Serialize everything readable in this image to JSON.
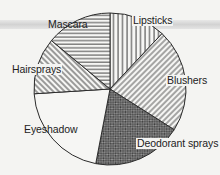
{
  "chart_data": {
    "type": "pie",
    "title": "",
    "start_angle_deg": 0,
    "direction": "clockwise",
    "categories": [
      "Lipsticks",
      "Blushers",
      "Deodorant sprays",
      "Eyeshadow",
      "Hairsprays",
      "Mascara"
    ],
    "values": [
      12,
      22,
      19,
      21,
      12,
      14
    ],
    "units": "percent (estimated from slice angles)",
    "patterns": [
      "vertical-lines",
      "diagonal-lines-right",
      "dark-crosshatch",
      "plain-white",
      "diagonal-lines-left",
      "horizontal-lines"
    ],
    "legend": "none (labels placed beside slices)"
  },
  "labels": {
    "lipsticks": "Lipsticks",
    "blushers": "Blushers",
    "deodorant": "Deodorant sprays",
    "eyeshadow": "Eyeshadow",
    "hairsprays": "Hairsprays",
    "mascara": "Mascara"
  },
  "colors": {
    "background": "#f4f4f2",
    "stroke": "#2a2a2a",
    "dark_fill": "#6b6b6b"
  }
}
